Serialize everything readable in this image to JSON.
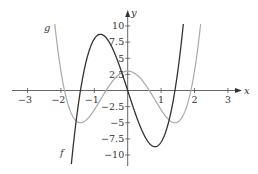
{
  "chart_data": {
    "type": "line",
    "title": "",
    "xlabel": "x",
    "ylabel": "y",
    "xlim": [
      -3.4,
      3.4
    ],
    "ylim": [
      -11,
      10.5
    ],
    "grid": false,
    "legend": "inline curve labels",
    "x_ticks": [
      -3,
      -2,
      -1,
      1,
      2,
      3
    ],
    "x_tick_labels": [
      "−3",
      "−2",
      "−1",
      "1",
      "2",
      "3"
    ],
    "y_ticks": [
      10,
      7.5,
      5,
      2.5,
      -2.5,
      -5,
      -7.5,
      -10
    ],
    "y_tick_labels": [
      "10",
      "7.5",
      "5",
      "2.5",
      "−2.5",
      "−5",
      "−7.5",
      "−10"
    ],
    "series": [
      {
        "name": "f",
        "color": "#333333",
        "formula": "8x^3 - 16x",
        "x": [
          -1.75,
          -1.5,
          -1.41,
          -1.25,
          -1.0,
          -0.82,
          -0.5,
          -0.25,
          0,
          0.25,
          0.5,
          0.82,
          1.0,
          1.25,
          1.41,
          1.5,
          1.72
        ],
        "y": [
          -14.9,
          -3.0,
          0,
          4.4,
          8.0,
          8.71,
          7.0,
          3.9,
          0,
          -3.9,
          -7.0,
          -8.71,
          -8.0,
          -4.4,
          0,
          3.0,
          13.2
        ]
      },
      {
        "name": "g",
        "color": "#aaaaaa",
        "formula": "2x^4 - 8x^2 + 3",
        "x": [
          -2.2,
          -2.0,
          -1.89,
          -1.6,
          -1.41,
          -1.2,
          -1.0,
          -0.65,
          -0.4,
          0,
          0.4,
          0.65,
          1.0,
          1.2,
          1.41,
          1.6,
          1.89,
          2.0,
          2.2
        ],
        "y": [
          10.7,
          3.0,
          0,
          -4.4,
          -5.0,
          -4.4,
          -3.0,
          0,
          1.8,
          3.0,
          1.8,
          0,
          -3.0,
          -4.4,
          -5.0,
          -4.4,
          0,
          3.0,
          10.7
        ]
      }
    ]
  },
  "labels": {
    "x_axis": "x",
    "y_axis": "y",
    "f": "f",
    "g": "g"
  }
}
